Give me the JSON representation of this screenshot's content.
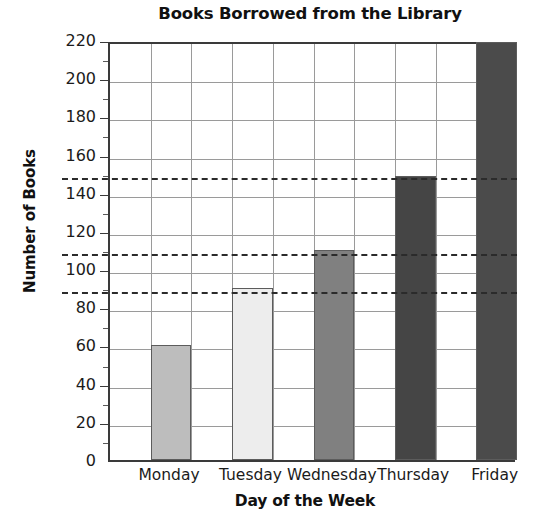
{
  "chart_data": {
    "type": "bar",
    "title": "Books Borrowed from the Library",
    "xlabel": "Day of the Week",
    "ylabel": "Number of Books",
    "categories": [
      "Monday",
      "Tuesday",
      "Wednesday",
      "Thursday",
      "Friday"
    ],
    "values": [
      60,
      90,
      110,
      149,
      219
    ],
    "ylim": [
      0,
      220
    ],
    "ytick_step": 20,
    "yticks": [
      0,
      20,
      40,
      60,
      80,
      100,
      120,
      140,
      160,
      180,
      200,
      220
    ],
    "ytick_labels": [
      "0",
      "20",
      "40",
      "60",
      "80",
      "100",
      "120",
      "140",
      "160",
      "180",
      "200",
      "220"
    ],
    "minor_tick_step": 10,
    "grid": "both",
    "legend": "none",
    "reference_lines": [
      90,
      110,
      150
    ],
    "bar_colors": [
      "#bdbdbd",
      "#ededed",
      "#808080",
      "#454545",
      "#4b4b4b"
    ]
  }
}
